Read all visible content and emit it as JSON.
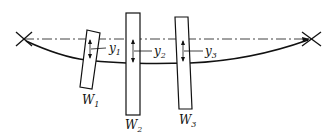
{
  "diagram": {
    "masses": [
      {
        "label": "W",
        "sub": "1",
        "deflection": "y",
        "deflection_sub": "1"
      },
      {
        "label": "W",
        "sub": "2",
        "deflection": "y",
        "deflection_sub": "2"
      },
      {
        "label": "W",
        "sub": "3",
        "deflection": "y",
        "deflection_sub": "3"
      }
    ],
    "colors": {
      "line": "#111111",
      "background": "#ffffff"
    }
  }
}
